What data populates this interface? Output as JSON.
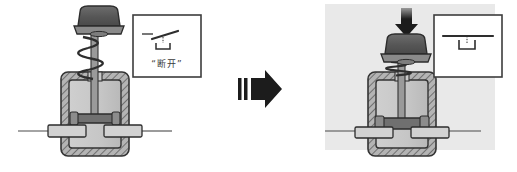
{
  "figure": {
    "type": "technical-cutaway-diagram",
    "background_color": "#ffffff",
    "panel_background_color": "#e9e9e9"
  },
  "colors": {
    "outline": "#333333",
    "housing_hatch": "#8d8d8d",
    "housing_fill": "#bdbdbd",
    "chamber_fill": "#c9c9c9",
    "cap_dark": "#565656",
    "cap_mid": "#6e6e6e",
    "flange": "#8a8a8a",
    "stem": "#9a9a9a",
    "bridge": "#707070",
    "terminal": "#d2d2d2",
    "wire": "#4a4a4a",
    "arrow_dark": "#1c1c1c",
    "label_box_border": "#3d3d3d",
    "label_text": "#3a3a3a"
  },
  "left_state": {
    "name": "de-energized",
    "label_box": {
      "symbol": "open-switch-symbol",
      "caption": "“断开”"
    },
    "spring": "extended",
    "contact_bridge": "raised-gap",
    "plunger_arrow": "none"
  },
  "right_state": {
    "name": "energized",
    "label_box": {
      "symbol": "closed-switch-symbol",
      "caption": "“闭合”"
    },
    "spring": "compressed",
    "contact_bridge": "lowered-touching",
    "plunger_arrow": "down-arrow"
  },
  "transition": {
    "arrow": "block-right-arrow"
  }
}
